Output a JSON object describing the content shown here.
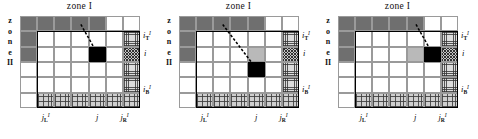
{
  "figure": {
    "panel_count": 3,
    "grid": {
      "columns": 7,
      "rows": 6
    }
  },
  "labels": {
    "zone_top": "zone I",
    "zone_left_chars": [
      "z",
      "o",
      "n",
      "e",
      "II"
    ],
    "y_top": {
      "base": "i",
      "sup": "I",
      "sub": "T"
    },
    "y_mid": {
      "base": "i",
      "sup": "",
      "sub": ""
    },
    "y_bottom": {
      "base": "i",
      "sup": "I",
      "sub": "B"
    },
    "x_left": {
      "base": "j",
      "sup": "I",
      "sub": "L"
    },
    "x_mid": {
      "base": "j",
      "sup": "",
      "sub": ""
    },
    "x_right": {
      "base": "j",
      "sup": "I",
      "sub": "R"
    }
  },
  "colors": {
    "zone2_fill": "#6f6f6f",
    "gray_fill": "#b9b9b9",
    "target_fill": "#000000",
    "grid_line": "#9a9a9a",
    "frame_line": "#000000",
    "page_bg": "#ffffff"
  },
  "panels": [
    {
      "name": "panel-left",
      "target_cell": {
        "col": 4,
        "row": 2
      },
      "gray_cells": [],
      "arrow": {
        "from": {
          "col": 3,
          "row": 0
        },
        "to": {
          "col": 4,
          "row": 2
        }
      }
    },
    {
      "name": "panel-middle",
      "target_cell": {
        "col": 4,
        "row": 3
      },
      "gray_cells": [
        {
          "col": 4,
          "row": 2
        }
      ],
      "arrow": {
        "from": {
          "col": 2,
          "row": 0
        },
        "to": {
          "col": 4,
          "row": 3
        }
      }
    },
    {
      "name": "panel-right",
      "target_cell": {
        "col": 5,
        "row": 2
      },
      "gray_cells": [
        {
          "col": 4,
          "row": 2
        }
      ],
      "arrow": {
        "from": {
          "col": 4,
          "row": 0
        },
        "to": {
          "col": 5,
          "row": 2
        }
      }
    }
  ]
}
